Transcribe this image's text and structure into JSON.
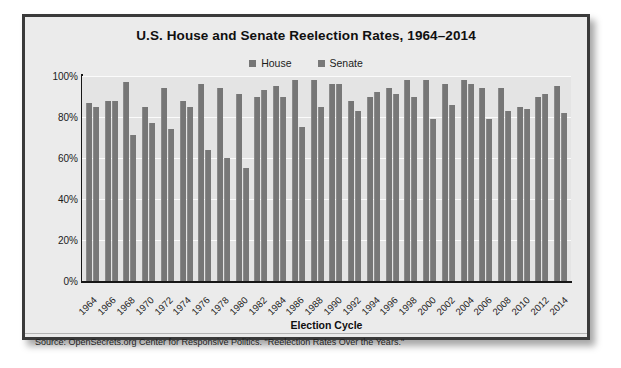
{
  "figure": {
    "title": "U.S. House and Senate Reelection Rates, 1964–2014",
    "x_axis_title": "Election Cycle",
    "source_note": "Source: OpenSecrets.org Center for Responsive Politics. \"Reelection Rates Over the Years.\"",
    "border_color": "#3a3a3a",
    "background_color": "#ebebeb",
    "plot_background_color": "#e4e4e4",
    "gridline_color": "#fbfbfb"
  },
  "legend": {
    "position": "top-center",
    "entries": [
      {
        "label": "House",
        "color": "#767676",
        "swatch_name": "house-swatch"
      },
      {
        "label": "Senate",
        "color": "#787878",
        "swatch_name": "senate-swatch"
      }
    ]
  },
  "y_axis": {
    "ticks": [
      "0%",
      "20%",
      "40%",
      "60%",
      "80%",
      "100%"
    ],
    "min": 0,
    "max": 100
  },
  "chart_data": {
    "type": "bar",
    "title": "U.S. House and Senate Reelection Rates, 1964–2014",
    "xlabel": "Election Cycle",
    "ylabel": "",
    "ylim": [
      0,
      100
    ],
    "ytick_labels": [
      "0%",
      "20%",
      "40%",
      "60%",
      "80%",
      "100%"
    ],
    "grid": true,
    "legend_position": "top-center",
    "units": "percent",
    "categories": [
      "1964",
      "1966",
      "1968",
      "1970",
      "1972",
      "1974",
      "1976",
      "1978",
      "1980",
      "1982",
      "1984",
      "1986",
      "1988",
      "1990",
      "1992",
      "1994",
      "1996",
      "1998",
      "2000",
      "2002",
      "2004",
      "2006",
      "2008",
      "2010",
      "2012",
      "2014"
    ],
    "series": [
      {
        "name": "House",
        "color": "#767676",
        "values": [
          87,
          88,
          97,
          85,
          94,
          88,
          96,
          94,
          91,
          90,
          95,
          98,
          98,
          96,
          88,
          90,
          94,
          98,
          98,
          96,
          98,
          94,
          94,
          85,
          90,
          95
        ]
      },
      {
        "name": "Senate",
        "color": "#787878",
        "values": [
          85,
          88,
          71,
          77,
          74,
          85,
          64,
          60,
          55,
          93,
          90,
          75,
          85,
          96,
          83,
          92,
          91,
          90,
          79,
          86,
          96,
          79,
          83,
          84,
          91,
          82
        ]
      }
    ]
  }
}
